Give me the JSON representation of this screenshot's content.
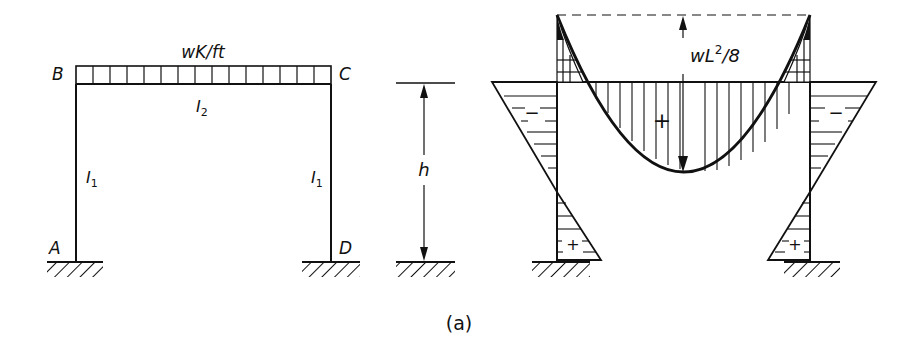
{
  "figure": {
    "caption": "(a)",
    "frame": {
      "load_label": "wK/ft",
      "joints": {
        "A": "A",
        "B": "B",
        "C": "C",
        "D": "D"
      },
      "beam_inertia": "I",
      "beam_inertia_sub": "2",
      "column_inertia": "I",
      "column_inertia_sub": "1",
      "load_segments": 15
    },
    "dimension": {
      "height_label": "h"
    },
    "moment_diagram": {
      "midspan_label": "wL",
      "midspan_label_sup": "2",
      "midspan_label_tail": "/8",
      "beam_sign": "+",
      "column_top_sign": "−",
      "column_base_sign": "+"
    },
    "colors": {
      "ink": "#111111",
      "background": "#ffffff"
    }
  }
}
